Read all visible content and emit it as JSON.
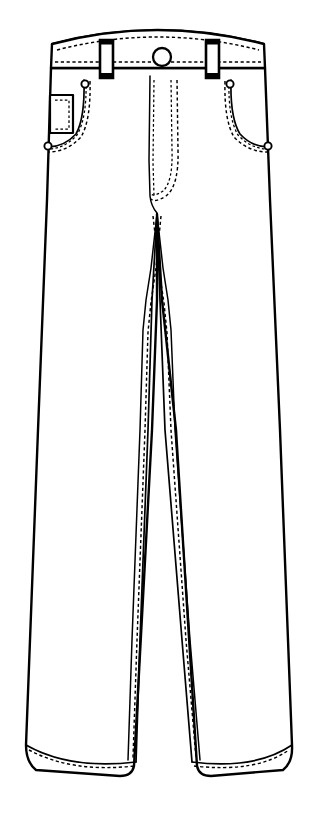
{
  "image": {
    "kind": "technical-flat-sketch",
    "subject": "Men's five-pocket jeans / trousers, front view",
    "width": 315,
    "height": 816,
    "background_color": "#ffffff",
    "line_color": "#000000",
    "fill_color": "#ffffff",
    "waistband_inner_shade": "#d2d2d2",
    "style": "line art, black outline on white, dashed topstitching"
  },
  "parts": {
    "waistband": {
      "name": "Waistband",
      "inner_band_label": "Waistband inside facing"
    },
    "belt_loops": [
      {
        "name": "Left belt loop",
        "position": "left-front"
      },
      {
        "name": "Right belt loop",
        "position": "right-front"
      }
    ],
    "closure": {
      "button": "Waist button",
      "fly": "Zip fly with J-stitch topstitching"
    },
    "pockets": {
      "left_front": "Left front scoop pocket",
      "right_front": "Right front scoop pocket",
      "coin": "Coin / watch pocket"
    },
    "rivets": [
      {
        "name": "Left pocket top rivet"
      },
      {
        "name": "Left pocket bottom rivet"
      },
      {
        "name": "Right pocket top rivet"
      },
      {
        "name": "Right pocket bottom rivet"
      }
    ],
    "legs": {
      "left": "Left leg",
      "right": "Right leg",
      "inseam": "Inseam topstitching",
      "outseam": "Side seam"
    },
    "hems": [
      {
        "name": "Left hem"
      },
      {
        "name": "Right hem"
      }
    ]
  }
}
